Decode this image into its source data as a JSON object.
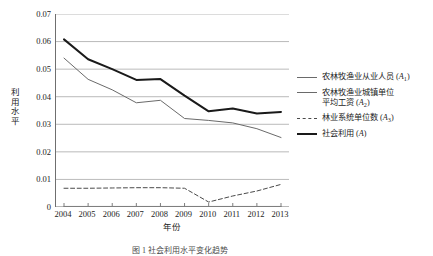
{
  "figure": {
    "y_axis_title": "利用水平",
    "x_axis_title": "年份",
    "caption": "图 1  社会利用水平变化趋势"
  },
  "legend": {
    "items": [
      {
        "name": "legend-item-a1",
        "style": "thin",
        "label_line1": "农林牧渔业从业人员 (A",
        "sub": "1",
        "label_line1_tail": ")",
        "label_line2": ""
      },
      {
        "name": "legend-item-a2",
        "style": "thin",
        "label_line1": "农林牧渔业城镇单位",
        "sub": "2",
        "label_line1_tail": ")",
        "label_line2": "平均工资 (A"
      },
      {
        "name": "legend-item-a3",
        "style": "dash",
        "label_line1": "林业系统单位数 (A",
        "sub": "3",
        "label_line1_tail": ")",
        "label_line2": ""
      },
      {
        "name": "legend-item-a",
        "style": "thick",
        "label_line1": "社会利用 (A",
        "sub": "",
        "label_line1_tail": ")",
        "label_line2": ""
      }
    ]
  },
  "chart_data": {
    "type": "line",
    "title": "",
    "xlabel": "年份",
    "ylabel": "利用水平",
    "x": [
      2004,
      2005,
      2006,
      2007,
      2008,
      2009,
      2010,
      2011,
      2012,
      2013
    ],
    "categories": [
      "2004",
      "2005",
      "2006",
      "2007",
      "2008",
      "2009",
      "2010",
      "2011",
      "2012",
      "2013"
    ],
    "ylim": [
      0,
      0.07
    ],
    "yticks": [
      0,
      0.01,
      0.02,
      0.03,
      0.04,
      0.05,
      0.06,
      0.07
    ],
    "ytick_labels": [
      "0",
      "0.01",
      "0.02",
      "0.03",
      "0.04",
      "0.05",
      "0.06",
      "0.07"
    ],
    "grid": true,
    "grid_axis": "y",
    "legend_position": "right",
    "series": [
      {
        "name": "农林牧渔业从业人员 (A1)",
        "key": "A1",
        "style": "solid-thin",
        "color": "#6a6a6a",
        "width": 1,
        "values": [
          0.054,
          0.0463,
          0.0425,
          0.0378,
          0.0387,
          0.0321,
          0.0314,
          0.0305,
          0.0284,
          0.0252
        ]
      },
      {
        "name": "农林牧渔业城镇单位平均工资 (A2)",
        "key": "A2",
        "style": "solid-thin",
        "color": "#8a8a8a",
        "width": 1,
        "values": [
          0.0002,
          0.0002,
          0.0002,
          0.0002,
          0.0002,
          0.0002,
          0.0002,
          0.0002,
          0.0002,
          0.0002
        ]
      },
      {
        "name": "林业系统单位数 (A3)",
        "key": "A3",
        "style": "dashed",
        "color": "#4a4a4a",
        "width": 1,
        "values": [
          0.0068,
          0.0068,
          0.0069,
          0.007,
          0.007,
          0.0068,
          0.0018,
          0.004,
          0.0058,
          0.0082
        ]
      },
      {
        "name": "社会利用 (A)",
        "key": "A",
        "style": "solid-thick",
        "color": "#1a1a1a",
        "width": 2,
        "values": [
          0.0608,
          0.0536,
          0.05,
          0.0461,
          0.0464,
          0.0404,
          0.0347,
          0.0357,
          0.0339,
          0.0345
        ]
      }
    ]
  },
  "colors": {
    "grid": "#a8a8a8",
    "axis": "#6f6f6f",
    "text": "#232323",
    "background": "#ffffff"
  }
}
